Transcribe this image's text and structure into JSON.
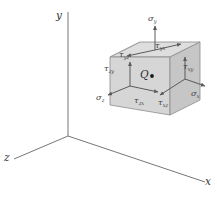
{
  "figure": {
    "background_color": "#ffffff",
    "line_color": "#555555",
    "cube_face_colors": {
      "top": "#dcdcdc",
      "front_right": "#c9c9c9",
      "left": "#d2d2d2"
    }
  },
  "axes": [
    {
      "id": "y-axis",
      "label": "y",
      "direction": "up"
    },
    {
      "id": "x-axis",
      "label": "x",
      "direction": "lower-right"
    },
    {
      "id": "z-axis",
      "label": "z",
      "direction": "lower-left"
    }
  ],
  "point": {
    "label": "Q",
    "marker": "filled-dot"
  },
  "stresses": [
    {
      "id": "sigma-y",
      "symbol": "σ",
      "subscript": "y",
      "type": "normal",
      "face": "top",
      "label": "sigma-y"
    },
    {
      "id": "sigma-x",
      "symbol": "σ",
      "subscript": "x",
      "type": "normal",
      "face": "right",
      "label": "sigma-x"
    },
    {
      "id": "sigma-z",
      "symbol": "σ",
      "subscript": "z",
      "type": "normal",
      "face": "front-left",
      "label": "sigma-z"
    },
    {
      "id": "tau-yx",
      "symbol": "τ",
      "subscript": "yx",
      "type": "shear",
      "face": "top",
      "label": "tau-yx"
    },
    {
      "id": "tau-yz",
      "symbol": "τ",
      "subscript": "yz",
      "type": "shear",
      "face": "top",
      "label": "tau-yz"
    },
    {
      "id": "tau-zy",
      "symbol": "τ",
      "subscript": "zy",
      "type": "shear",
      "face": "front",
      "label": "tau-zy"
    },
    {
      "id": "tau-zx",
      "symbol": "τ",
      "subscript": "zx",
      "type": "shear",
      "face": "front",
      "label": "tau-zx"
    },
    {
      "id": "tau-xy",
      "symbol": "τ",
      "subscript": "xy",
      "type": "shear",
      "face": "right",
      "label": "tau-xy"
    },
    {
      "id": "tau-xz",
      "symbol": "τ",
      "subscript": "xz",
      "type": "shear",
      "face": "right",
      "label": "tau-xz"
    }
  ]
}
